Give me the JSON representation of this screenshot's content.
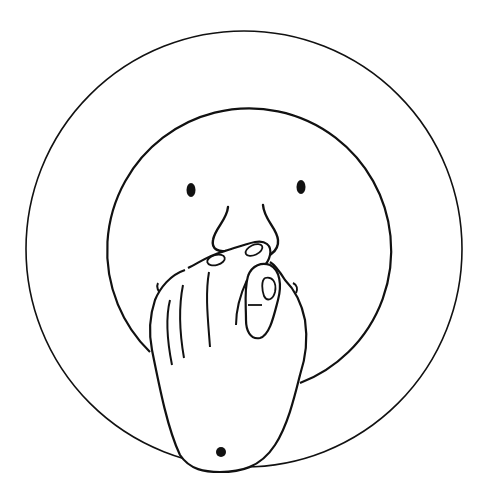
{
  "illustration": {
    "description": "Line drawing of a face inside a circle with a hand pinching/covering the nose and mouth",
    "colors": {
      "ink": "#111111",
      "background": "#ffffff"
    },
    "outer_circle": {
      "cx": 244,
      "cy": 249,
      "r": 218
    },
    "face_circle": {
      "cx": 246,
      "cy": 250,
      "r": 142
    },
    "eyes": [
      {
        "cx": 191,
        "cy": 190
      },
      {
        "cx": 301,
        "cy": 187
      }
    ]
  }
}
